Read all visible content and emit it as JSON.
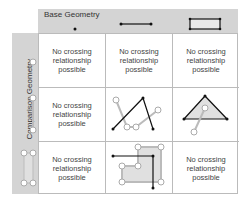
{
  "header": {
    "title": "Base Geometry",
    "columns": [
      "point",
      "line",
      "polygon"
    ]
  },
  "side": {
    "title": "Comparison Geometry",
    "rows": [
      "point",
      "line",
      "polygon"
    ]
  },
  "cells": {
    "r0c0": "No crossing relationship possible",
    "r0c1": "No crossing relationship possible",
    "r0c2": "No crossing relationship possible",
    "r1c0": "No crossing relationship possible",
    "r2c0": "No crossing relationship possible",
    "r2c2": "No crossing relationship possible"
  },
  "colors": {
    "band": "#d4d4d4",
    "base": "#111111",
    "comparison": "#b0b0b0",
    "fill": "#e4e4e4"
  }
}
